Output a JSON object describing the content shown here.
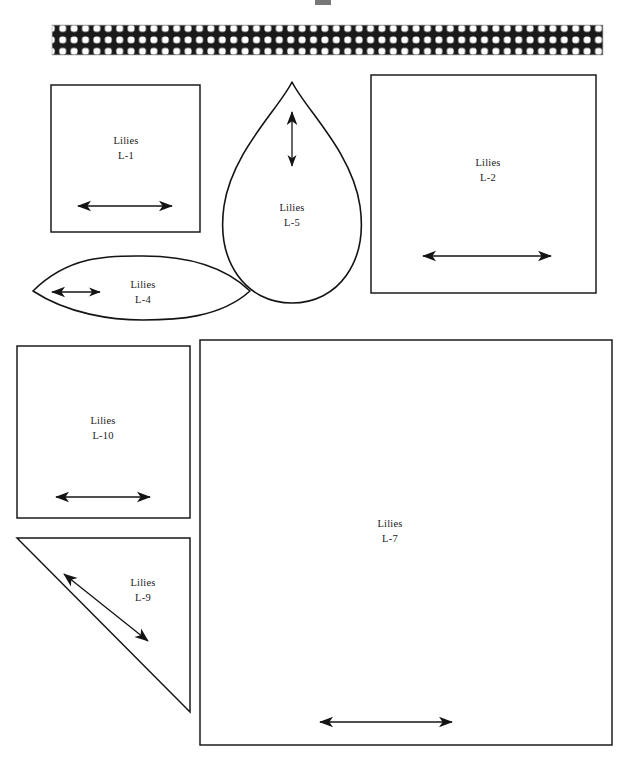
{
  "page": {
    "background_color": "#ffffff",
    "ink_color": "#141414",
    "width": 629,
    "height": 762
  },
  "fabric_strip": {
    "name": "checkered-fabric-strip",
    "pattern": "black ground with white rounded-square dots, 3 rows",
    "dot_color": "#ffffff",
    "ground_color": "#1a1a1a",
    "x": 52,
    "y": 25,
    "width": 551,
    "height": 30
  },
  "top_mark": {
    "name": "cropped-mark",
    "x": 315,
    "y": 0,
    "width": 16,
    "height": 6
  },
  "pieces": [
    {
      "id": "L-1",
      "shape": "rectangle",
      "name_line": "Lilies",
      "code_line": "L-1",
      "x": 51,
      "y": 85,
      "width": 149,
      "height": 147,
      "label_x": 126,
      "label_y": 144,
      "grain": {
        "type": "horizontal-double-arrow",
        "x1": 78,
        "y1": 206,
        "x2": 172,
        "y2": 206
      }
    },
    {
      "id": "L-2",
      "shape": "rectangle",
      "name_line": "Lilies",
      "code_line": "L-2",
      "x": 371,
      "y": 75,
      "width": 225,
      "height": 218,
      "label_x": 488,
      "label_y": 166,
      "grain": {
        "type": "horizontal-double-arrow",
        "x1": 423,
        "y1": 256,
        "x2": 551,
        "y2": 256
      }
    },
    {
      "id": "L-5",
      "shape": "teardrop",
      "name_line": "Lilies",
      "code_line": "L-5",
      "label_x": 292,
      "label_y": 211,
      "grain": {
        "type": "vertical-double-arrow",
        "x1": 292,
        "y1": 112,
        "x2": 292,
        "y2": 166
      }
    },
    {
      "id": "L-4",
      "shape": "lens-leaf",
      "name_line": "Lilies",
      "code_line": "L-4",
      "label_x": 143,
      "label_y": 288,
      "grain": {
        "type": "horizontal-double-arrow",
        "x1": 50,
        "y1": 292,
        "x2": 102,
        "y2": 292
      }
    },
    {
      "id": "L-10",
      "shape": "rectangle",
      "name_line": "Lilies",
      "code_line": "L-10",
      "x": 17,
      "y": 346,
      "width": 173,
      "height": 172,
      "label_x": 103,
      "label_y": 424,
      "grain": {
        "type": "horizontal-double-arrow",
        "x1": 56,
        "y1": 497,
        "x2": 150,
        "y2": 497
      }
    },
    {
      "id": "L-9",
      "shape": "right-triangle",
      "name_line": "Lilies",
      "code_line": "L-9",
      "label_x": 143,
      "label_y": 586,
      "grain": {
        "type": "diagonal-double-arrow",
        "x1": 63,
        "y1": 573,
        "x2": 148,
        "y2": 641
      }
    },
    {
      "id": "L-7",
      "shape": "rectangle",
      "name_line": "Lilies",
      "code_line": "L-7",
      "x": 200,
      "y": 340,
      "width": 412,
      "height": 405,
      "label_x": 390,
      "label_y": 527,
      "grain": {
        "type": "horizontal-double-arrow",
        "x1": 320,
        "y1": 722,
        "x2": 452,
        "y2": 722
      }
    }
  ]
}
